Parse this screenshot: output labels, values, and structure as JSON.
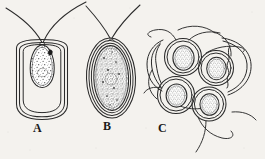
{
  "figure": {
    "kind": "scientific-line-illustration",
    "background_color": "#f4f2ee",
    "ink_color": "#2b2b2b",
    "stipple_color": "#555555",
    "panels": [
      {
        "id": "A",
        "label": "A",
        "description": "single cell with two long flagella inside a rounded-rectangular double-walled envelope; pear-shaped stippled protoplast at top with dark eyespot",
        "flagella_count": 2,
        "envelope_shape": "rounded-rectangle",
        "wall_layers": 2,
        "protoplast_shape": "pear",
        "has_eyespot": true
      },
      {
        "id": "B",
        "label": "B",
        "description": "single ovoid cell with two long flagella; triple-layered oval envelope completely filled by a densely stippled protoplast",
        "flagella_count": 2,
        "envelope_shape": "oval",
        "wall_layers": 3,
        "protoplast_shape": "ovoid",
        "has_eyespot": false
      },
      {
        "id": "C",
        "label": "C",
        "description": "cluster of four rounded double-walled cells with small round stippled protoplasts, trailing flagella, and two empty wavy-margined collapsed cyst walls alongside",
        "cell_count": 4,
        "empty_walls_count": 2,
        "flagella_count": 5,
        "envelope_shape": "round",
        "wall_layers": 2,
        "protoplast_shape": "round",
        "has_eyespot": false
      }
    ],
    "labels": {
      "a": "A",
      "b": "B",
      "c": "C"
    }
  }
}
